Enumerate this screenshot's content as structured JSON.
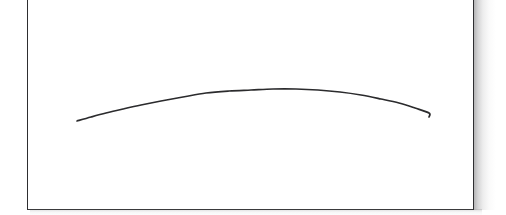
{
  "canvas": {
    "width": 506,
    "height": 215,
    "background_color": "#ffffff"
  },
  "figure": {
    "title": "",
    "caption": "",
    "frame": {
      "name": "figure-frame",
      "left": 27,
      "top": -6,
      "width": 447,
      "height": 216,
      "fill_color": "#ffffff",
      "border_color": "#2e2e30",
      "border_width_px": 1.6,
      "top_edge_cropped": true
    },
    "shadow": {
      "name": "drop-shadow",
      "color": "#78787a",
      "side": "right-and-bottom",
      "spread_px": 22
    }
  },
  "chart_data": {
    "type": "line",
    "title": "",
    "subtitle": "",
    "xlabel": "",
    "ylabel": "",
    "grid": false,
    "legend": null,
    "axis_visible": false,
    "tick_labels_x": [],
    "tick_labels_y": [],
    "xlim": [
      0,
      447
    ],
    "ylim": [
      216,
      0
    ],
    "series": [
      {
        "name": "arc-curve",
        "color": "#2b2b2d",
        "line_width_px": 1.7,
        "line_style": "solid",
        "markers": false,
        "x": [
          49,
          63,
          78,
          95,
          113,
          133,
          155,
          178,
          201,
          223,
          245,
          268,
          290,
          312,
          333,
          353,
          371,
          387,
          401,
          401
        ],
        "y": [
          127,
          123,
          119,
          115,
          111,
          107,
          103,
          99,
          97,
          96,
          95,
          95,
          96,
          98,
          101,
          105,
          109,
          114,
          119,
          123
        ]
      }
    ],
    "annotations": []
  }
}
